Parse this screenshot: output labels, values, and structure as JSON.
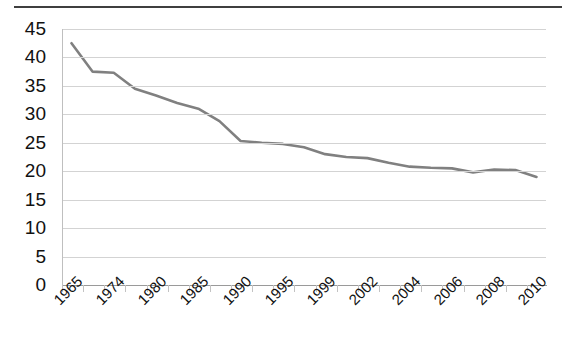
{
  "chart_data": {
    "type": "line",
    "title": "",
    "xlabel": "",
    "ylabel": "",
    "ylim": [
      0,
      45
    ],
    "ytick_step": 5,
    "yticks": [
      "45",
      "40",
      "35",
      "30",
      "25",
      "20",
      "15",
      "10",
      "5",
      "0"
    ],
    "grid": true,
    "legend": false,
    "line_color": "#808080",
    "line_width": 2.6,
    "x_tick_labels": [
      "1965",
      "1974",
      "1980",
      "1985",
      "1990",
      "1995",
      "1999",
      "2002",
      "2004",
      "2006",
      "2008",
      "2010"
    ],
    "x_label_rotation": -45,
    "x": [
      1965,
      1970,
      1974,
      1977,
      1980,
      1983,
      1985,
      1987,
      1990,
      1992,
      1995,
      1997,
      1999,
      2000,
      2002,
      2003,
      2004,
      2005,
      2006,
      2007,
      2008,
      2009,
      2010
    ],
    "values": [
      42.5,
      37.5,
      37.3,
      34.5,
      33.3,
      32.0,
      31.0,
      28.8,
      25.3,
      25.0,
      24.8,
      24.2,
      23.0,
      22.5,
      22.3,
      21.5,
      20.8,
      20.6,
      20.5,
      19.8,
      20.3,
      20.2,
      19.0
    ],
    "series": [
      {
        "name": "series-1",
        "values": [
          42.5,
          37.5,
          37.3,
          34.5,
          33.3,
          32.0,
          31.0,
          28.8,
          25.3,
          25.0,
          24.8,
          24.2,
          23.0,
          22.5,
          22.3,
          21.5,
          20.8,
          20.6,
          20.5,
          19.8,
          20.3,
          20.2,
          19.0
        ]
      }
    ]
  },
  "colors": {
    "line": "#808080",
    "grid": "#d3d3d3",
    "axis": "#9a9a9a",
    "border": "#3f3f3f",
    "text": "#111111"
  }
}
